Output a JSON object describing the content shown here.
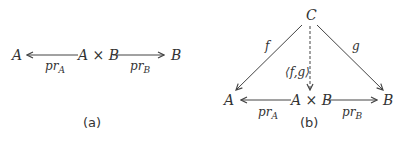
{
  "diagram_a": {
    "caption": "(a)",
    "nodes": {
      "left": "A",
      "center": "A × B",
      "right": "B"
    },
    "edges": [
      {
        "from": "A × B",
        "to": "A",
        "label": "pr",
        "label_sub": "A"
      },
      {
        "from": "A × B",
        "to": "B",
        "label": "pr",
        "label_sub": "B"
      }
    ]
  },
  "diagram_b": {
    "caption": "(b)",
    "nodes": {
      "top": "C",
      "left": "A",
      "center": "A × B",
      "right": "B"
    },
    "edges": [
      {
        "from": "C",
        "to": "A",
        "label": "f"
      },
      {
        "from": "C",
        "to": "B",
        "label": "g"
      },
      {
        "from": "C",
        "to": "A × B",
        "label": "⟨f,g⟩",
        "style": "dashed"
      },
      {
        "from": "A × B",
        "to": "A",
        "label": "pr",
        "label_sub": "A"
      },
      {
        "from": "A × B",
        "to": "B",
        "label": "pr",
        "label_sub": "B"
      }
    ]
  },
  "colors": {
    "ink": "#333333",
    "background": "#ffffff"
  }
}
